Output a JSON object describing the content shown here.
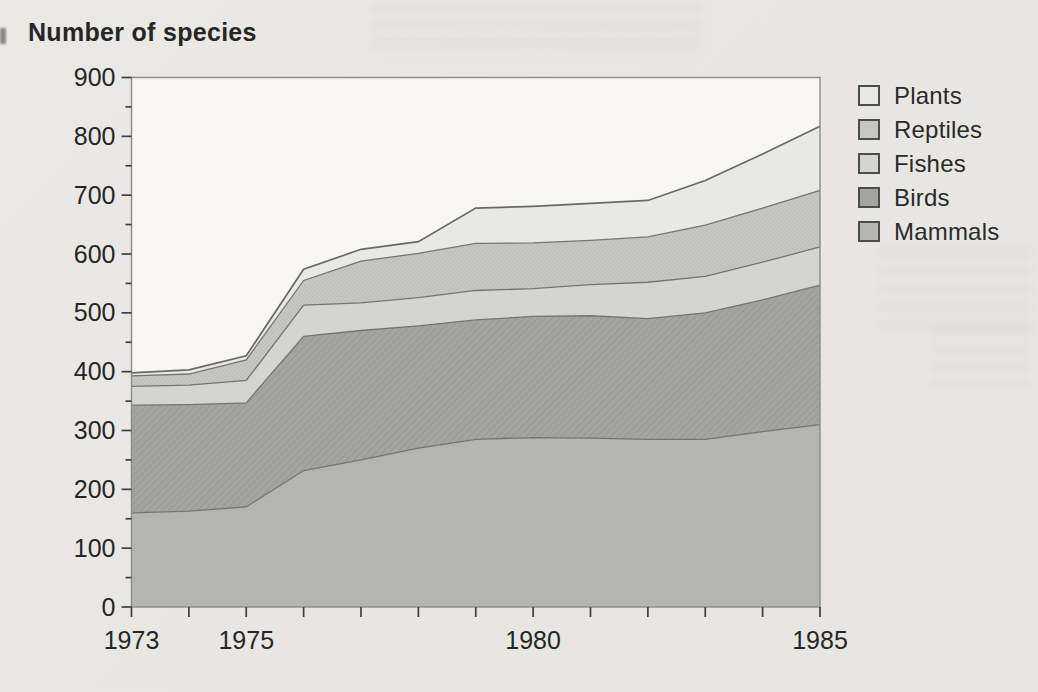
{
  "title": "Number of species",
  "legend": {
    "items": [
      {
        "label": "Plants",
        "color": "#e8e8e5"
      },
      {
        "label": "Reptiles",
        "color": "#c6c6c3"
      },
      {
        "label": "Fishes",
        "color": "#d4d4d1"
      },
      {
        "label": "Birds",
        "color": "#a4a4a1"
      },
      {
        "label": "Mammals",
        "color": "#b5b5b2"
      }
    ]
  },
  "colors": {
    "paper": "#e9e7e3",
    "plot_background": "#f7f6f3",
    "frame": "#8a8a8a",
    "boundary_line": "#747474",
    "outer_boundary_line": "#696969",
    "tick": "#3f3f3f",
    "text": "#262626"
  },
  "chart_data": {
    "type": "area",
    "stacked": true,
    "title": "Number of species",
    "xlabel": "",
    "ylabel": "Number of species",
    "x": [
      1973,
      1974,
      1975,
      1976,
      1977,
      1978,
      1979,
      1980,
      1981,
      1982,
      1983,
      1984,
      1985
    ],
    "series": [
      {
        "name": "Mammals",
        "color": "#b5b5b2",
        "texture": "stipple-light",
        "values": [
          160,
          163,
          170,
          232,
          250,
          270,
          285,
          288,
          287,
          285,
          285,
          298,
          310
        ]
      },
      {
        "name": "Birds",
        "color": "#a4a4a1",
        "texture": "hatch",
        "values": [
          183,
          181,
          177,
          228,
          220,
          208,
          203,
          206,
          208,
          205,
          215,
          224,
          237
        ]
      },
      {
        "name": "Fishes",
        "color": "#d4d4d1",
        "texture": "none",
        "values": [
          32,
          33,
          38,
          53,
          47,
          48,
          50,
          47,
          53,
          62,
          62,
          64,
          65
        ]
      },
      {
        "name": "Reptiles",
        "color": "#c6c6c3",
        "texture": "stipple",
        "values": [
          18,
          19,
          35,
          42,
          71,
          75,
          80,
          78,
          75,
          77,
          87,
          92,
          96
        ]
      },
      {
        "name": "Plants",
        "color": "#e8e8e5",
        "texture": "none",
        "values": [
          5,
          7,
          7,
          19,
          20,
          20,
          60,
          62,
          63,
          62,
          76,
          92,
          109
        ]
      }
    ],
    "cumulative_totals": [
      398,
      403,
      427,
      574,
      608,
      621,
      678,
      681,
      686,
      691,
      725,
      770,
      817
    ],
    "ylim": [
      0,
      900
    ],
    "y_major_step": 100,
    "y_minor_step": 50,
    "y_tick_labels": [
      "0",
      "100",
      "200",
      "300",
      "400",
      "500",
      "600",
      "700",
      "800",
      "900"
    ],
    "x_tick_labels": [
      {
        "x": 1973,
        "label": "1973"
      },
      {
        "x": 1975,
        "label": "1975"
      },
      {
        "x": 1980,
        "label": "1980"
      },
      {
        "x": 1985,
        "label": "1985"
      }
    ],
    "grid": false,
    "legend_position": "outside-top-right",
    "legend_order_top_to_bottom": [
      "Plants",
      "Reptiles",
      "Fishes",
      "Birds",
      "Mammals"
    ]
  }
}
